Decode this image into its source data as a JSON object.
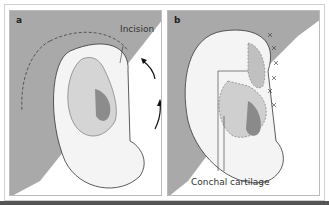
{
  "figure": {
    "panels": [
      {
        "label": "a",
        "callouts": [
          "Incision"
        ]
      },
      {
        "label": "b",
        "callouts": [
          "Conchal cartilage"
        ]
      }
    ],
    "colors": {
      "background_wedge": "#a8a8a8",
      "skin": "#f2f2f2",
      "concha": "#9a9a9a",
      "line": "#333333"
    }
  }
}
